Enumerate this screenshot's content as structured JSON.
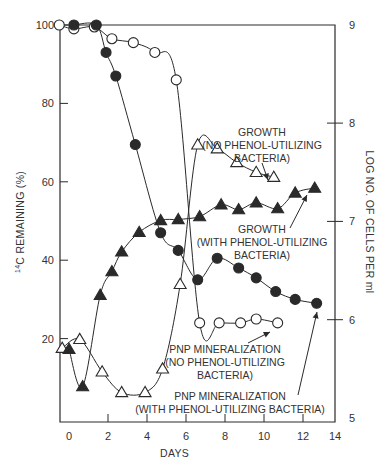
{
  "chart_data": {
    "type": "line",
    "title": "",
    "xlabel": "DAYS",
    "ylabel": "14C REMAINING (%)",
    "ylabel_right": "LOG NO. OF CELLS PER ml",
    "xlim": [
      -0.5,
      13.6
    ],
    "ylim": [
      0,
      100
    ],
    "ylim_right": [
      5,
      9
    ],
    "x_ticks": [
      0,
      2,
      4,
      6,
      8,
      10,
      12,
      14
    ],
    "y_ticks": [
      20,
      40,
      60,
      80,
      100
    ],
    "y_ticks_right": [
      5,
      6,
      7,
      8,
      9
    ],
    "grid": false,
    "legend": "none (curves labeled by inline annotations with arrows)",
    "series": [
      {
        "name": "PNP MINERALIZATION (NO PHENOL-UTILIZING BACTERIA)",
        "axis": "left",
        "marker": "open-circle",
        "x": [
          -0.5,
          0.25,
          1.3,
          2.2,
          3.3,
          4.4,
          5.5,
          6.7,
          7.7,
          8.8,
          9.6,
          10.7
        ],
        "y": [
          100,
          99,
          99.5,
          96.5,
          95.5,
          93,
          86,
          24,
          24,
          24,
          25,
          24
        ]
      },
      {
        "name": "PNP MINERALIZATION (WITH PHENOL-UTILIZING BACTERIA)",
        "axis": "left",
        "marker": "filled-circle",
        "x": [
          0.25,
          1.4,
          1.9,
          2.4,
          3.4,
          4.7,
          5.6,
          6.6,
          7.6,
          8.7,
          9.6,
          10.6,
          11.6,
          12.7
        ],
        "y": [
          100,
          100,
          93,
          87,
          69.5,
          47,
          42.5,
          35,
          40.5,
          38,
          35.5,
          32,
          30,
          29
        ]
      },
      {
        "name": "GROWTH (NO PHENOL-UTILIZING BACTERIA)",
        "axis": "right",
        "marker": "open-triangle",
        "x": [
          -0.35,
          0.55,
          1.7,
          2.7,
          3.9,
          4.8,
          5.7,
          6.6,
          7.6,
          8.6,
          9.6,
          10.5
        ],
        "y": [
          5.71,
          5.8,
          5.47,
          5.26,
          5.26,
          5.5,
          6.36,
          7.78,
          7.74,
          7.6,
          7.5,
          7.45
        ]
      },
      {
        "name": "GROWTH (WITH PHENOL-UTILIZING BACTERIA)",
        "axis": "right",
        "marker": "filled-triangle",
        "x": [
          0.0,
          0.7,
          1.6,
          2.2,
          2.7,
          3.6,
          4.7,
          5.6,
          6.7,
          7.8,
          8.7,
          9.6,
          10.7,
          11.6,
          12.6
        ],
        "y": [
          5.7,
          5.32,
          6.25,
          6.49,
          6.69,
          6.89,
          7.01,
          7.02,
          7.05,
          7.17,
          7.12,
          7.19,
          7.13,
          7.29,
          7.34
        ]
      }
    ],
    "annotations": [
      {
        "lines": [
          "GROWTH",
          "(NO PHENOL-UTILIZING",
          "BACTERIA)"
        ],
        "target": "GROWTH (NO PHENOL-UTILIZING BACTERIA)"
      },
      {
        "lines": [
          "GROWTH",
          "(WITH PHENOL-UTILIZING",
          "BACTERIA)"
        ],
        "target": "GROWTH (WITH PHENOL-UTILIZING BACTERIA)"
      },
      {
        "lines": [
          "PNP MINERALIZATION",
          "(NO PHENOL-UTILIZING",
          "BACTERIA)"
        ],
        "target": "PNP MINERALIZATION (NO PHENOL-UTILIZING BACTERIA)"
      },
      {
        "lines": [
          "PNP MINERALIZATION",
          "(WITH PHENOL-UTILIZING BACTERIA)"
        ],
        "target": "PNP MINERALIZATION (WITH PHENOL-UTILIZING BACTERIA)"
      }
    ]
  },
  "layout": {
    "plot_left": 60,
    "plot_right": 335,
    "plot_top": 25,
    "plot_bottom": 422,
    "x0_px": 69,
    "px_per_day": 19.5,
    "left_zero_px": 417,
    "left_px_per_unit": 3.92,
    "right_5_px": 418,
    "right_px_per_unit": 98.3,
    "ink": "#2a2a2a"
  }
}
